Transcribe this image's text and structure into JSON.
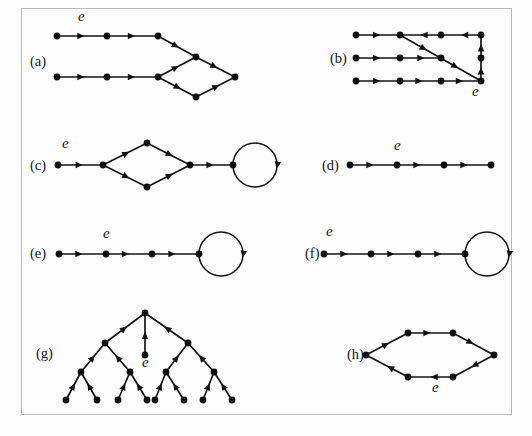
{
  "figure": {
    "background_color": "#fdfdfd",
    "frame_color": "#b9b9b9",
    "ink_color": "#121316",
    "node_radius": 3.4,
    "edge_label": "e",
    "panels": [
      {
        "id": "a",
        "label": "(a)",
        "label_x": 30,
        "label_y": 66,
        "e_labels": [
          {
            "text": "e",
            "x": 78,
            "y": 21
          }
        ],
        "nodes": [
          {
            "id": "a1",
            "x": 57,
            "y": 36
          },
          {
            "id": "a2",
            "x": 107,
            "y": 36
          },
          {
            "id": "a3",
            "x": 158,
            "y": 36
          },
          {
            "id": "a4",
            "x": 57,
            "y": 77
          },
          {
            "id": "a5",
            "x": 107,
            "y": 77
          },
          {
            "id": "a6",
            "x": 158,
            "y": 77
          },
          {
            "id": "a7",
            "x": 196,
            "y": 57
          },
          {
            "id": "a8",
            "x": 196,
            "y": 97
          },
          {
            "id": "a9",
            "x": 235,
            "y": 77
          }
        ],
        "edges": [
          {
            "from": "a1",
            "to": "a2",
            "arrows": [
              0.55
            ]
          },
          {
            "from": "a2",
            "to": "a3",
            "arrows": [
              0.55
            ]
          },
          {
            "from": "a4",
            "to": "a5",
            "arrows": [
              0.55
            ]
          },
          {
            "from": "a5",
            "to": "a6",
            "arrows": [
              0.55
            ]
          },
          {
            "from": "a3",
            "to": "a7",
            "arrows": [
              0.55
            ]
          },
          {
            "from": "a6",
            "to": "a7",
            "arrows": [
              0.55
            ]
          },
          {
            "from": "a6",
            "to": "a8",
            "arrows": [
              0.6
            ]
          },
          {
            "from": "a7",
            "to": "a9",
            "arrows": [
              0.55
            ]
          },
          {
            "from": "a8",
            "to": "a9",
            "arrows": [
              0.6
            ]
          }
        ],
        "loops": []
      },
      {
        "id": "b",
        "label": "(b)",
        "label_x": 330,
        "label_y": 63,
        "e_labels": [
          {
            "text": "e",
            "x": 472,
            "y": 96
          }
        ],
        "nodes": [
          {
            "id": "b1",
            "x": 356,
            "y": 35
          },
          {
            "id": "b2",
            "x": 400,
            "y": 35
          },
          {
            "id": "b3",
            "x": 441,
            "y": 35
          },
          {
            "id": "b4",
            "x": 481,
            "y": 35
          },
          {
            "id": "b5",
            "x": 356,
            "y": 58
          },
          {
            "id": "b6",
            "x": 400,
            "y": 58
          },
          {
            "id": "b7",
            "x": 441,
            "y": 58
          },
          {
            "id": "b8",
            "x": 356,
            "y": 81
          },
          {
            "id": "b9",
            "x": 400,
            "y": 81
          },
          {
            "id": "b10",
            "x": 441,
            "y": 81
          },
          {
            "id": "b11",
            "x": 481,
            "y": 81
          },
          {
            "id": "b12",
            "x": 481,
            "y": 58
          }
        ],
        "edges": [
          {
            "from": "b1",
            "to": "b2",
            "arrows": [
              0.55
            ]
          },
          {
            "from": "b4",
            "to": "b3",
            "arrows": [
              0.5
            ]
          },
          {
            "from": "b3",
            "to": "b2",
            "arrows": [
              0.5
            ]
          },
          {
            "from": "b5",
            "to": "b6",
            "arrows": [
              0.55
            ]
          },
          {
            "from": "b6",
            "to": "b7",
            "arrows": [
              0.6
            ]
          },
          {
            "from": "b8",
            "to": "b9",
            "arrows": [
              0.55
            ]
          },
          {
            "from": "b9",
            "to": "b10",
            "arrows": [
              0.55
            ]
          },
          {
            "from": "b10",
            "to": "b11",
            "arrows": [
              0.55
            ]
          },
          {
            "from": "b11",
            "to": "b12",
            "arrows": [
              0.6
            ]
          },
          {
            "from": "b12",
            "to": "b4",
            "arrows": [
              0.6
            ]
          },
          {
            "from": "b2",
            "to": "b11",
            "arrows": [
              0.33,
              0.72
            ]
          }
        ],
        "loops": []
      },
      {
        "id": "c",
        "label": "(c)",
        "label_x": 30,
        "label_y": 170,
        "e_labels": [
          {
            "text": "e",
            "x": 62,
            "y": 148
          }
        ],
        "nodes": [
          {
            "id": "c1",
            "x": 58,
            "y": 165
          },
          {
            "id": "c2",
            "x": 103,
            "y": 165
          },
          {
            "id": "c3",
            "x": 147,
            "y": 143
          },
          {
            "id": "c4",
            "x": 147,
            "y": 187
          },
          {
            "id": "c5",
            "x": 190,
            "y": 165
          },
          {
            "id": "c6",
            "x": 233,
            "y": 165
          }
        ],
        "edges": [
          {
            "from": "c1",
            "to": "c2",
            "arrows": [
              0.55
            ]
          },
          {
            "from": "c2",
            "to": "c3",
            "arrows": [
              0.6
            ]
          },
          {
            "from": "c2",
            "to": "c4",
            "arrows": [
              0.6
            ]
          },
          {
            "from": "c3",
            "to": "c5",
            "arrows": [
              0.6
            ]
          },
          {
            "from": "c4",
            "to": "c5",
            "arrows": [
              0.6
            ]
          },
          {
            "from": "c5",
            "to": "c6",
            "arrows": [
              0.55
            ]
          }
        ],
        "loops": [
          {
            "at": "c6",
            "radius": 22,
            "arrow_angle": 10
          }
        ]
      },
      {
        "id": "d",
        "label": "(d)",
        "label_x": 322,
        "label_y": 170,
        "e_labels": [
          {
            "text": "e",
            "x": 394,
            "y": 150
          }
        ],
        "nodes": [
          {
            "id": "d1",
            "x": 350,
            "y": 165
          },
          {
            "id": "d2",
            "x": 397,
            "y": 165
          },
          {
            "id": "d3",
            "x": 444,
            "y": 165
          },
          {
            "id": "d4",
            "x": 491,
            "y": 165
          }
        ],
        "edges": [
          {
            "from": "d1",
            "to": "d2",
            "arrows": [
              0.5
            ]
          },
          {
            "from": "d2",
            "to": "d3",
            "arrows": [
              0.5
            ]
          },
          {
            "from": "d3",
            "to": "d4",
            "arrows": [
              0.5
            ]
          }
        ],
        "loops": []
      },
      {
        "id": "e",
        "label": "(e)",
        "label_x": 30,
        "label_y": 258,
        "e_labels": [
          {
            "text": "e",
            "x": 103,
            "y": 238
          }
        ],
        "nodes": [
          {
            "id": "e1",
            "x": 59,
            "y": 254
          },
          {
            "id": "e2",
            "x": 106,
            "y": 254
          },
          {
            "id": "e3",
            "x": 152,
            "y": 254
          },
          {
            "id": "e4",
            "x": 199,
            "y": 254
          }
        ],
        "edges": [
          {
            "from": "e1",
            "to": "e2",
            "arrows": [
              0.5
            ]
          },
          {
            "from": "e2",
            "to": "e3",
            "arrows": [
              0.5
            ]
          },
          {
            "from": "e3",
            "to": "e4",
            "arrows": [
              0.5
            ]
          }
        ],
        "loops": [
          {
            "at": "e4",
            "radius": 22,
            "arrow_angle": 10
          }
        ]
      },
      {
        "id": "f",
        "label": "(f)",
        "label_x": 305,
        "label_y": 258,
        "e_labels": [
          {
            "text": "e",
            "x": 326,
            "y": 236
          }
        ],
        "nodes": [
          {
            "id": "f1",
            "x": 324,
            "y": 254
          },
          {
            "id": "f2",
            "x": 371,
            "y": 254
          },
          {
            "id": "f3",
            "x": 418,
            "y": 254
          },
          {
            "id": "f4",
            "x": 465,
            "y": 254
          }
        ],
        "edges": [
          {
            "from": "f1",
            "to": "f2",
            "arrows": [
              0.5
            ]
          },
          {
            "from": "f2",
            "to": "f3",
            "arrows": [
              0.5
            ]
          },
          {
            "from": "f3",
            "to": "f4",
            "arrows": [
              0.5
            ]
          }
        ],
        "loops": [
          {
            "at": "f4",
            "radius": 22,
            "arrow_angle": 10
          }
        ]
      },
      {
        "id": "g",
        "label": "(g)",
        "label_x": 36,
        "label_y": 358,
        "e_labels": [
          {
            "text": "e",
            "x": 142,
            "y": 367
          }
        ],
        "nodes": [
          {
            "id": "g_root",
            "x": 145,
            "y": 313
          },
          {
            "id": "g_e",
            "x": 145,
            "y": 355
          },
          {
            "id": "g_l",
            "x": 105,
            "y": 343
          },
          {
            "id": "g_r",
            "x": 188,
            "y": 343
          },
          {
            "id": "g_ll",
            "x": 81,
            "y": 372
          },
          {
            "id": "g_lr",
            "x": 130,
            "y": 372
          },
          {
            "id": "g_rl",
            "x": 166,
            "y": 372
          },
          {
            "id": "g_rr",
            "x": 214,
            "y": 372
          },
          {
            "id": "g_lll",
            "x": 66,
            "y": 400
          },
          {
            "id": "g_llr",
            "x": 97,
            "y": 400
          },
          {
            "id": "g_lrl",
            "x": 118,
            "y": 400
          },
          {
            "id": "g_lrr",
            "x": 147,
            "y": 400
          },
          {
            "id": "g_rll",
            "x": 155,
            "y": 400
          },
          {
            "id": "g_rlr",
            "x": 184,
            "y": 400
          },
          {
            "id": "g_rrl",
            "x": 203,
            "y": 400
          },
          {
            "id": "g_rrr",
            "x": 232,
            "y": 400
          }
        ],
        "edges": [
          {
            "from": "g_e",
            "to": "g_root",
            "arrows": [
              0.55
            ]
          },
          {
            "from": "g_l",
            "to": "g_root",
            "arrows": [
              0.55
            ]
          },
          {
            "from": "g_r",
            "to": "g_root",
            "arrows": [
              0.55
            ]
          },
          {
            "from": "g_ll",
            "to": "g_l",
            "arrows": [
              0.58
            ]
          },
          {
            "from": "g_lr",
            "to": "g_l",
            "arrows": [
              0.58
            ]
          },
          {
            "from": "g_rl",
            "to": "g_r",
            "arrows": [
              0.58
            ]
          },
          {
            "from": "g_rr",
            "to": "g_r",
            "arrows": [
              0.58
            ]
          },
          {
            "from": "g_lll",
            "to": "g_ll",
            "arrows": [
              0.6
            ]
          },
          {
            "from": "g_llr",
            "to": "g_ll",
            "arrows": [
              0.6
            ]
          },
          {
            "from": "g_lrl",
            "to": "g_lr",
            "arrows": [
              0.6
            ]
          },
          {
            "from": "g_lrr",
            "to": "g_lr",
            "arrows": [
              0.6
            ]
          },
          {
            "from": "g_rll",
            "to": "g_rl",
            "arrows": [
              0.6
            ]
          },
          {
            "from": "g_rlr",
            "to": "g_rl",
            "arrows": [
              0.6
            ]
          },
          {
            "from": "g_rrl",
            "to": "g_rr",
            "arrows": [
              0.6
            ]
          },
          {
            "from": "g_rrr",
            "to": "g_rr",
            "arrows": [
              0.6
            ]
          }
        ],
        "loops": []
      },
      {
        "id": "h",
        "label": "(h)",
        "label_x": 347,
        "label_y": 359,
        "e_labels": [
          {
            "text": "e",
            "x": 432,
            "y": 392
          }
        ],
        "nodes": [
          {
            "id": "h1",
            "x": 366,
            "y": 355
          },
          {
            "id": "h2",
            "x": 408,
            "y": 333
          },
          {
            "id": "h3",
            "x": 453,
            "y": 333
          },
          {
            "id": "h4",
            "x": 494,
            "y": 355
          },
          {
            "id": "h5",
            "x": 453,
            "y": 377
          },
          {
            "id": "h6",
            "x": 408,
            "y": 377
          }
        ],
        "edges": [
          {
            "from": "h1",
            "to": "h2",
            "arrows": [
              0.55
            ]
          },
          {
            "from": "h2",
            "to": "h3",
            "arrows": [
              0.5
            ]
          },
          {
            "from": "h3",
            "to": "h4",
            "arrows": [
              0.5
            ]
          },
          {
            "from": "h4",
            "to": "h5",
            "arrows": [
              0.55
            ]
          },
          {
            "from": "h5",
            "to": "h6",
            "arrows": [
              0.5
            ]
          },
          {
            "from": "h6",
            "to": "h1",
            "arrows": [
              0.5
            ]
          }
        ],
        "loops": []
      }
    ]
  }
}
